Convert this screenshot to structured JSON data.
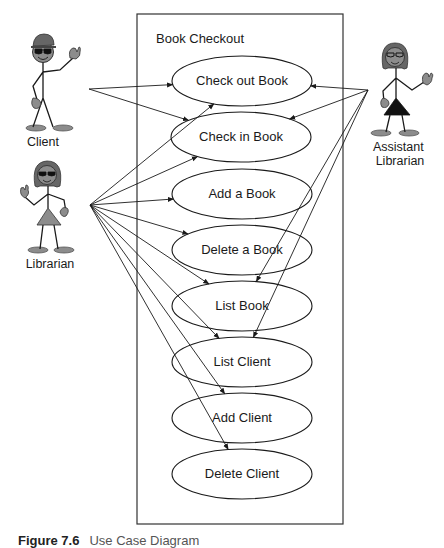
{
  "system": {
    "title": "Book Checkout",
    "box": {
      "x": 137,
      "y": 14,
      "width": 206,
      "height": 510
    }
  },
  "use_cases": [
    {
      "id": "check-out-book",
      "label": "Check out Book",
      "cx": 242,
      "cy": 81
    },
    {
      "id": "check-in-book",
      "label": "Check in Book",
      "cx": 241,
      "cy": 137
    },
    {
      "id": "add-a-book",
      "label": "Add a Book",
      "cx": 242,
      "cy": 194
    },
    {
      "id": "delete-a-book",
      "label": "Delete a Book",
      "cx": 242,
      "cy": 250
    },
    {
      "id": "list-book",
      "label": "List Book",
      "cx": 242,
      "cy": 306
    },
    {
      "id": "list-client",
      "label": "List Client",
      "cx": 242,
      "cy": 362
    },
    {
      "id": "add-client",
      "label": "Add Client",
      "cx": 242,
      "cy": 418
    },
    {
      "id": "delete-client",
      "label": "Delete Client",
      "cx": 242,
      "cy": 474
    }
  ],
  "actors": [
    {
      "id": "client",
      "label": "Client",
      "origin": [
        89,
        89
      ],
      "targets": [
        "check-out-book",
        "check-in-book"
      ]
    },
    {
      "id": "librarian",
      "label": "Librarian",
      "origin": [
        90,
        205
      ],
      "targets": [
        "check-out-book",
        "check-in-book",
        "add-a-book",
        "delete-a-book",
        "list-book",
        "list-client",
        "add-client",
        "delete-client"
      ]
    },
    {
      "id": "assistant-librarian",
      "label": "Assistant Librarian",
      "label_lines": [
        "Assistant",
        "Librarian"
      ],
      "origin": [
        368,
        90
      ],
      "targets": [
        "check-out-book",
        "check-in-book",
        "list-book",
        "list-client"
      ]
    }
  ],
  "caption": {
    "figure": "Figure 7.6",
    "text": "Use Case Diagram"
  },
  "colors": {
    "line": "#1a1a1a",
    "figure_fill": "#8c8c8c",
    "figure_dark": "#555555"
  }
}
